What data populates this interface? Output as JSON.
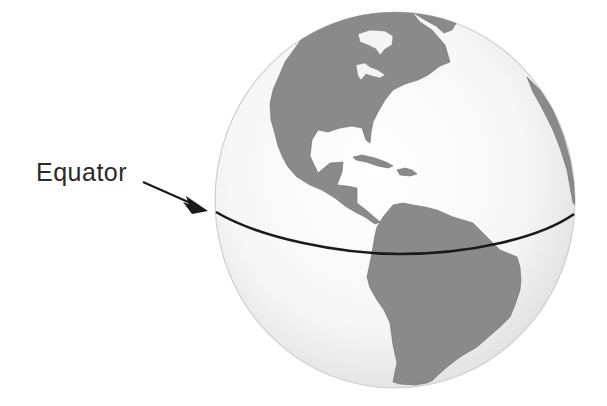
{
  "diagram": {
    "label": "Equator",
    "colors": {
      "background": "#ffffff",
      "ocean": "#f4f4f4",
      "ocean_edge": "#d8d8d8",
      "land": "#8a8a8a",
      "equator_line": "#1a1a1a",
      "label_text": "#2a2a2a",
      "arrow": "#1a1a1a"
    },
    "regions": [
      "North America",
      "Central America",
      "Caribbean",
      "South America",
      "West Africa (edge)",
      "Greenland (edge)"
    ]
  }
}
